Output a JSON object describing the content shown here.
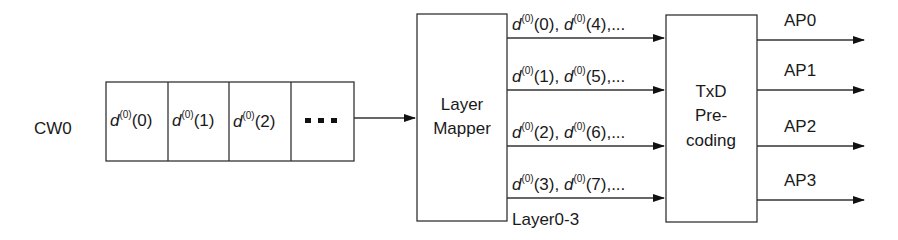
{
  "codeword_label": "CW0",
  "cells": [
    {
      "sym": "d",
      "sup": "(0)",
      "idx": "(0)"
    },
    {
      "sym": "d",
      "sup": "(0)",
      "idx": "(1)"
    },
    {
      "sym": "d",
      "sup": "(0)",
      "idx": "(2)"
    }
  ],
  "ellipsis": "...",
  "layer_mapper": {
    "line1": "Layer",
    "line2": "Mapper"
  },
  "layers": [
    {
      "a": "(0)",
      "b": "(4)"
    },
    {
      "a": "(1)",
      "b": "(5)"
    },
    {
      "a": "(2)",
      "b": "(6)"
    },
    {
      "a": "(3)",
      "b": "(7)"
    }
  ],
  "layer_sym": "d",
  "layer_sup": "(0)",
  "layer_tail": ",...",
  "layer_sep": ", ",
  "layers_caption": "Layer0-3",
  "precoder": {
    "line1": "TxD",
    "line2": "Pre-",
    "line3": "coding"
  },
  "antenna_ports": [
    "AP0",
    "AP1",
    "AP2",
    "AP3"
  ]
}
